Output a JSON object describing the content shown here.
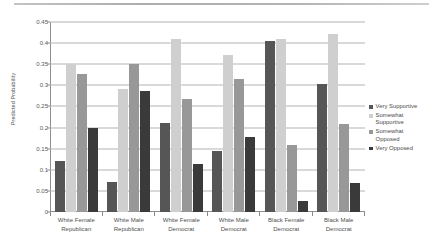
{
  "chart_data": {
    "type": "bar",
    "title": "",
    "subtitle": "",
    "xlabel": "",
    "ylabel": "Predicted Probability",
    "ylim": [
      0,
      0.45
    ],
    "ytick_step": 0.05,
    "yticks": [
      "0",
      "0.05",
      "0.1",
      "0.15",
      "0.2",
      "0.25",
      "0.3",
      "0.35",
      "0.4",
      "0.45"
    ],
    "ytick_values": [
      0,
      0.05,
      0.1,
      0.15,
      0.2,
      0.25,
      0.3,
      0.35,
      0.4,
      0.45
    ],
    "grid": "horizontal",
    "legend_position": "right",
    "categories": [
      "White Female\nRepublican",
      "White Male\nRepublican",
      "White Female\nDemocrat",
      "White Male\nDemocrat",
      "Black Female\nDemocrat",
      "Black Male\nDemocrat"
    ],
    "category_lines": [
      [
        "White Female",
        "Republican"
      ],
      [
        "White Male",
        "Republican"
      ],
      [
        "White Female",
        "Democrat"
      ],
      [
        "White Male",
        "Democrat"
      ],
      [
        "Black Female",
        "Democrat"
      ],
      [
        "Black Male",
        "Democrat"
      ]
    ],
    "series": [
      {
        "name": "Very Supportive",
        "color": "#565656",
        "values": [
          0.122,
          0.07,
          0.21,
          0.144,
          0.406,
          0.303
        ]
      },
      {
        "name": "Somewhat\nSupportive",
        "color": "#cfcfcf",
        "values": [
          0.351,
          0.291,
          0.41,
          0.372,
          0.409,
          0.422
        ]
      },
      {
        "name": "Somewhat\nOpposed",
        "color": "#989898",
        "values": [
          0.326,
          0.351,
          0.268,
          0.316,
          0.158,
          0.208
        ]
      },
      {
        "name": "Very Opposed",
        "color": "#3a3a3a",
        "values": [
          0.198,
          0.286,
          0.113,
          0.178,
          0.027,
          0.068
        ]
      }
    ]
  },
  "legend": {
    "items": [
      {
        "label": "Very Supportive",
        "color": "#565656"
      },
      {
        "label": "Somewhat\nSupportive",
        "color": "#cfcfcf"
      },
      {
        "label": "Somewhat\nOpposed",
        "color": "#989898"
      },
      {
        "label": "Very Opposed",
        "color": "#3a3a3a"
      }
    ]
  }
}
